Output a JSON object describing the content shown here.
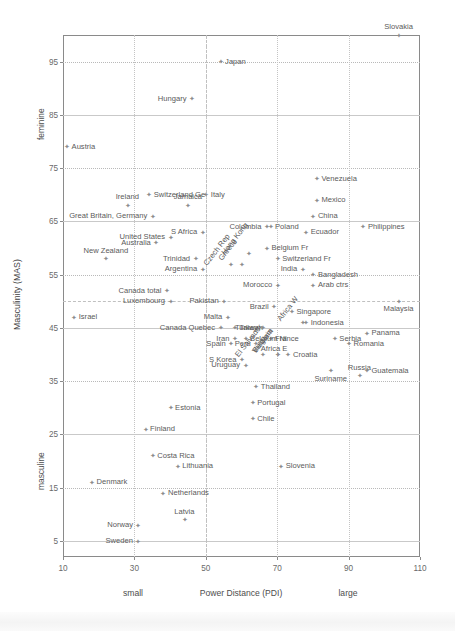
{
  "chart_data": {
    "type": "scatter",
    "title": "",
    "xlabel": "Power Distance (PDI)",
    "ylabel": "Masculinity (MAS)",
    "xlim": [
      10,
      110
    ],
    "ylim": [
      100,
      2
    ],
    "xticks": [
      10,
      30,
      50,
      70,
      90,
      110
    ],
    "yticks": [
      5,
      15,
      25,
      35,
      45,
      55,
      65,
      75,
      85,
      95
    ],
    "x_low_label": "small",
    "x_high_label": "large",
    "y_low_label": "feminine",
    "y_high_label": "masculine",
    "grid": true,
    "legend": "none",
    "points": [
      {
        "name": "Sweden",
        "x": 31,
        "y": 5,
        "lp": "r"
      },
      {
        "name": "Norway",
        "x": 31,
        "y": 8,
        "lp": "r"
      },
      {
        "name": "Latvia",
        "x": 44,
        "y": 9,
        "lp": "above"
      },
      {
        "name": "Netherlands",
        "x": 38,
        "y": 14,
        "lp": "l"
      },
      {
        "name": "Denmark",
        "x": 18,
        "y": 16,
        "lp": "l"
      },
      {
        "name": "Lithuania",
        "x": 42,
        "y": 19,
        "lp": "l"
      },
      {
        "name": "Costa Rica",
        "x": 35,
        "y": 21,
        "lp": "l"
      },
      {
        "name": "Slovenia",
        "x": 71,
        "y": 19,
        "lp": "l"
      },
      {
        "name": "Finland",
        "x": 33,
        "y": 26,
        "lp": "l"
      },
      {
        "name": "Estonia",
        "x": 40,
        "y": 30,
        "lp": "l"
      },
      {
        "name": "Chile",
        "x": 63,
        "y": 28,
        "lp": "l"
      },
      {
        "name": "Portugal",
        "x": 63,
        "y": 31,
        "lp": "l"
      },
      {
        "name": "Thailand",
        "x": 64,
        "y": 34,
        "lp": "l"
      },
      {
        "name": "Russia",
        "x": 93,
        "y": 36,
        "lp": "above"
      },
      {
        "name": "Guatemala",
        "x": 95,
        "y": 37,
        "lp": "l"
      },
      {
        "name": "Uruguay",
        "x": 61,
        "y": 38,
        "lp": "r"
      },
      {
        "name": "S Korea",
        "x": 60,
        "y": 39,
        "lp": "r"
      },
      {
        "name": "El Salvador",
        "x": 66,
        "y": 40,
        "lp": "rot"
      },
      {
        "name": "VietNam",
        "x": 70,
        "y": 40,
        "lp": "rot"
      },
      {
        "name": "Bulgaria",
        "x": 70,
        "y": 40,
        "lp": "rot"
      },
      {
        "name": "Suriname",
        "x": 85,
        "y": 37,
        "lp": "below"
      },
      {
        "name": "Croatia",
        "x": 73,
        "y": 40,
        "lp": "l"
      },
      {
        "name": "Spain",
        "x": 57,
        "y": 42,
        "lp": "r"
      },
      {
        "name": "Peru",
        "x": 64,
        "y": 42,
        "lp": "r"
      },
      {
        "name": "Africa E",
        "x": 64,
        "y": 41,
        "lp": "l"
      },
      {
        "name": "France",
        "x": 68,
        "y": 43,
        "lp": "l"
      },
      {
        "name": "Iran",
        "x": 58,
        "y": 43,
        "lp": "r"
      },
      {
        "name": "Belgium Nl",
        "x": 61,
        "y": 43,
        "lp": "l"
      },
      {
        "name": "Africa W",
        "x": 77,
        "y": 46,
        "lp": "rot"
      },
      {
        "name": "Romania",
        "x": 90,
        "y": 42,
        "lp": "l"
      },
      {
        "name": "Panama",
        "x": 95,
        "y": 44,
        "lp": "l"
      },
      {
        "name": "Serbia",
        "x": 86,
        "y": 43,
        "lp": "l"
      },
      {
        "name": "Canada Quebec",
        "x": 54,
        "y": 45,
        "lp": "r"
      },
      {
        "name": "Taiwan",
        "x": 58,
        "y": 45,
        "lp": "l"
      },
      {
        "name": "Turkey",
        "x": 66,
        "y": 45,
        "lp": "r"
      },
      {
        "name": "Indonesia",
        "x": 78,
        "y": 46,
        "lp": "l"
      },
      {
        "name": "Malta",
        "x": 56,
        "y": 47,
        "lp": "r"
      },
      {
        "name": "Singapore",
        "x": 74,
        "y": 48,
        "lp": "l"
      },
      {
        "name": "Brazil",
        "x": 69,
        "y": 49,
        "lp": "r"
      },
      {
        "name": "Israel",
        "x": 13,
        "y": 47,
        "lp": "l"
      },
      {
        "name": "Luxembourg",
        "x": 40,
        "y": 50,
        "lp": "r"
      },
      {
        "name": "Malaysia",
        "x": 104,
        "y": 50,
        "lp": "below"
      },
      {
        "name": "Canada total",
        "x": 39,
        "y": 52,
        "lp": "r"
      },
      {
        "name": "Pakistan",
        "x": 55,
        "y": 50,
        "lp": "r"
      },
      {
        "name": "Morocco",
        "x": 70,
        "y": 53,
        "lp": "r"
      },
      {
        "name": "Arab ctrs",
        "x": 80,
        "y": 53,
        "lp": "l"
      },
      {
        "name": "Bangladesh",
        "x": 80,
        "y": 55,
        "lp": "l"
      },
      {
        "name": "Czech Rep",
        "x": 57,
        "y": 57,
        "lp": "rot"
      },
      {
        "name": "Greece",
        "x": 60,
        "y": 57,
        "lp": "rot"
      },
      {
        "name": "Argentina",
        "x": 49,
        "y": 56,
        "lp": "r"
      },
      {
        "name": "New Zealand",
        "x": 22,
        "y": 58,
        "lp": "above"
      },
      {
        "name": "Trinidad",
        "x": 47,
        "y": 58,
        "lp": "r"
      },
      {
        "name": "India",
        "x": 77,
        "y": 56,
        "lp": "r"
      },
      {
        "name": "Switzerland Fr",
        "x": 70,
        "y": 58,
        "lp": "l"
      },
      {
        "name": "Hong Kong",
        "x": 62,
        "y": 59,
        "lp": "rot"
      },
      {
        "name": "Belgium Fr",
        "x": 67,
        "y": 60,
        "lp": "l"
      },
      {
        "name": "Australia",
        "x": 36,
        "y": 61,
        "lp": "r"
      },
      {
        "name": "S Africa",
        "x": 49,
        "y": 63,
        "lp": "r"
      },
      {
        "name": "United States",
        "x": 40,
        "y": 62,
        "lp": "r"
      },
      {
        "name": "Colombia",
        "x": 67,
        "y": 64,
        "lp": "r"
      },
      {
        "name": "Poland",
        "x": 68,
        "y": 64,
        "lp": "l"
      },
      {
        "name": "Ecuador",
        "x": 78,
        "y": 63,
        "lp": "l"
      },
      {
        "name": "Philippines",
        "x": 94,
        "y": 64,
        "lp": "l"
      },
      {
        "name": "Great Britain, Germany",
        "x": 35,
        "y": 66,
        "lp": "r"
      },
      {
        "name": "Jamaica",
        "x": 45,
        "y": 68,
        "lp": "above"
      },
      {
        "name": "China",
        "x": 80,
        "y": 66,
        "lp": "l"
      },
      {
        "name": "Ireland",
        "x": 28,
        "y": 68,
        "lp": "above"
      },
      {
        "name": "Italy",
        "x": 50,
        "y": 70,
        "lp": "l"
      },
      {
        "name": "Mexico",
        "x": 81,
        "y": 69,
        "lp": "l"
      },
      {
        "name": "Switzerland Ge",
        "x": 34,
        "y": 70,
        "lp": "l"
      },
      {
        "name": "Venezuela",
        "x": 81,
        "y": 73,
        "lp": "l"
      },
      {
        "name": "Austria",
        "x": 11,
        "y": 79,
        "lp": "l"
      },
      {
        "name": "Hungary",
        "x": 46,
        "y": 88,
        "lp": "r"
      },
      {
        "name": "Japan",
        "x": 54,
        "y": 95,
        "lp": "l"
      },
      {
        "name": "Slovakia",
        "x": 104,
        "y": 100,
        "lp": "above"
      }
    ]
  }
}
